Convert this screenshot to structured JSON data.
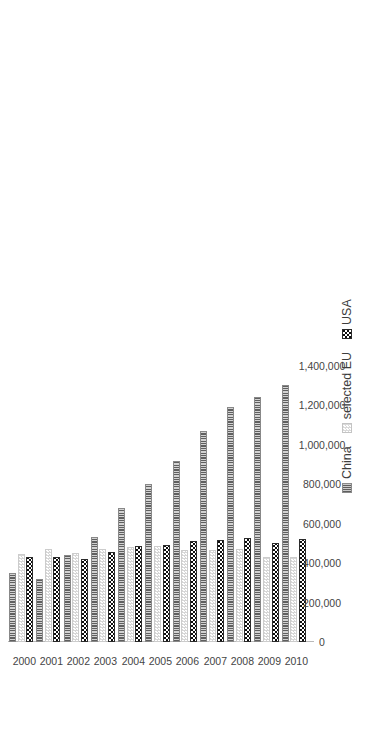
{
  "chart_data": {
    "type": "bar",
    "orientation": "vertical-rotated",
    "title": "",
    "xlabel": "",
    "ylabel": "",
    "categories": [
      "2000",
      "2001",
      "2002",
      "2003",
      "2004",
      "2005",
      "2006",
      "2007",
      "2008",
      "2009",
      "2010"
    ],
    "ylim": [
      0,
      1500000
    ],
    "ticks": [
      "0",
      "200,000",
      "400,000",
      "600,000",
      "800,000",
      "1,000,000",
      "1,200,000",
      "1,400,000"
    ],
    "tick_values": [
      0,
      200000,
      400000,
      600000,
      800000,
      1000000,
      1200000,
      1400000
    ],
    "grid": false,
    "legend_position": "top-left",
    "series": [
      {
        "name": "China",
        "pattern": "vertical-stripes",
        "color": "#5f5f5f",
        "values": [
          352000,
          320000,
          440000,
          530000,
          678000,
          800000,
          916000,
          1070000,
          1190000,
          1240000,
          1300000
        ]
      },
      {
        "name": "selected EU",
        "pattern": "light-dotted",
        "color": "#d6d6d6",
        "values": [
          448000,
          470000,
          452000,
          470000,
          480000,
          484000,
          468000,
          466000,
          470000,
          432000,
          430000
        ]
      },
      {
        "name": "USA",
        "pattern": "checkerboard",
        "color": "#0d0d0d",
        "values": [
          432000,
          430000,
          420000,
          455000,
          486000,
          490000,
          512000,
          518000,
          526000,
          500000,
          520000
        ]
      }
    ]
  },
  "legend": {
    "items": [
      {
        "label": "China"
      },
      {
        "label": "selected EU"
      },
      {
        "label": "USA"
      }
    ]
  }
}
